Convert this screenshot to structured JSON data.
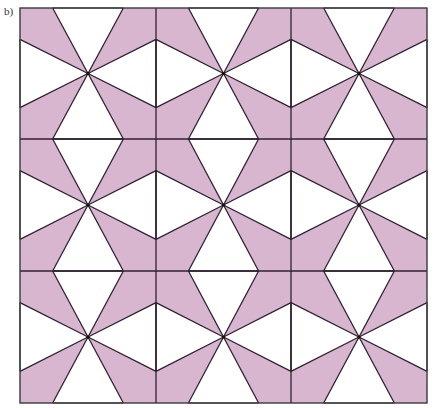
{
  "figure": {
    "label": "b)",
    "grid": {
      "rows": 3,
      "cols": 3
    },
    "frame": {
      "x0": 20,
      "y0": 8,
      "x1": 427,
      "y1": 403
    },
    "col_edges": [
      20,
      156,
      291,
      427
    ],
    "row_edges": [
      8,
      139,
      271,
      403
    ],
    "edge_split": [
      0.24,
      0.76
    ],
    "colors": {
      "shaded": "#d8b6d0",
      "unshaded": "#ffffff",
      "line": "#2e2230",
      "frame": "#3a3a3a"
    }
  }
}
